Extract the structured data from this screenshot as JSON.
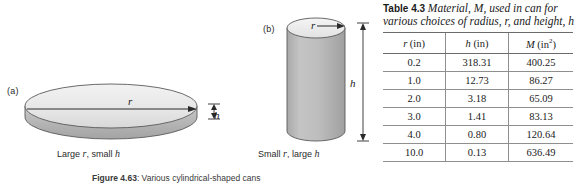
{
  "figure": {
    "panel_a": {
      "label": "(a)",
      "caption_prefix": "Large ",
      "caption_var1": "r",
      "caption_mid": ", small ",
      "caption_var2": "h",
      "radius_label": "r",
      "height_label": "h"
    },
    "panel_b": {
      "label": "(b)",
      "caption_prefix": "Small ",
      "caption_var1": "r",
      "caption_mid": ", large ",
      "caption_var2": "h",
      "radius_label": "r",
      "height_label": "h"
    },
    "figure_number": "Figure 4.63",
    "figure_caption": ": Various cylindrical-shaped cans",
    "colors": {
      "top_face": "#e8e8e8",
      "side_face": "#b9b9b9",
      "outline": "#555555"
    }
  },
  "table": {
    "tag": "Table 4.3",
    "description_line1": "Material, M, used in",
    "description_line2": "can for various choices of",
    "description_line3": "radius, r, and height, h",
    "headers": {
      "r": "r (in)",
      "h": "h (in)",
      "m": "M (in2)"
    },
    "header_parts": [
      {
        "var": "r",
        "unit": " (in)",
        "sup": ""
      },
      {
        "var": "h",
        "unit": " (in)",
        "sup": ""
      },
      {
        "var": "M",
        "unit": " (in",
        "sup": "2"
      }
    ],
    "rows": [
      {
        "r": "0.2",
        "h": "318.31",
        "m": "400.25"
      },
      {
        "r": "1.0",
        "h": "12.73",
        "m": "86.27"
      },
      {
        "r": "2.0",
        "h": "3.18",
        "m": "65.09"
      },
      {
        "r": "3.0",
        "h": "1.41",
        "m": "83.13"
      },
      {
        "r": "4.0",
        "h": "0.80",
        "m": "120.64"
      },
      {
        "r": "10.0",
        "h": "0.13",
        "m": "636.49"
      }
    ]
  },
  "chart_data": {
    "type": "table",
    "title": "Table 4.3 Material, M, used in can for various choices of radius, r, and height, h",
    "columns": [
      "r (in)",
      "h (in)",
      "M (in^2)"
    ],
    "rows": [
      [
        0.2,
        318.31,
        400.25
      ],
      [
        1.0,
        12.73,
        86.27
      ],
      [
        2.0,
        3.18,
        65.09
      ],
      [
        3.0,
        1.41,
        83.13
      ],
      [
        4.0,
        0.8,
        120.64
      ],
      [
        10.0,
        0.13,
        636.49
      ]
    ],
    "xlabel": "r (in)",
    "ylabel": "M (in^2)"
  }
}
